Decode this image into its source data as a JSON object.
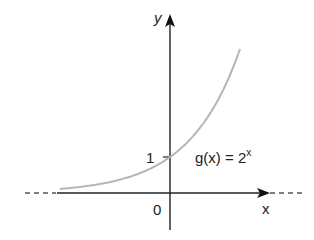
{
  "chart_data": {
    "type": "line",
    "title": "",
    "function_label": "g(x) = 2",
    "function_exponent": "x",
    "xlabel": "x",
    "ylabel": "y",
    "origin_label": "0",
    "y_tick_labels": [
      "1"
    ],
    "y_ticks": [
      1
    ],
    "x": [
      -3,
      -2,
      -1,
      0,
      1,
      2
    ],
    "series": [
      {
        "name": "g(x) = 2^x",
        "values": [
          0.125,
          0.25,
          0.5,
          1,
          2,
          4
        ]
      }
    ],
    "xlim": [
      -4.2,
      3.9
    ],
    "ylim": [
      -1,
      4.8
    ],
    "grid": false,
    "legend": "none",
    "colors": {
      "axis": "#222222",
      "curve": "#b5b5b5",
      "dash": "#555555"
    }
  }
}
